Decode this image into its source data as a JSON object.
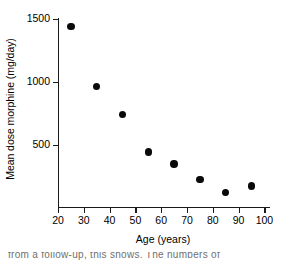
{
  "chart_data": {
    "type": "scatter",
    "title": "",
    "xlabel": "Age (years)",
    "ylabel": "Mean dose morphine (mg/day)",
    "x": [
      25,
      35,
      45,
      55,
      65,
      75,
      85,
      95
    ],
    "values": [
      1440,
      970,
      745,
      450,
      355,
      230,
      130,
      180
    ],
    "series": [
      {
        "name": "Mean dose morphine",
        "points": [
          {
            "x": 25,
            "y": 1440
          },
          {
            "x": 35,
            "y": 970
          },
          {
            "x": 45,
            "y": 745
          },
          {
            "x": 55,
            "y": 450
          },
          {
            "x": 65,
            "y": 355
          },
          {
            "x": 75,
            "y": 230
          },
          {
            "x": 85,
            "y": 130
          },
          {
            "x": 95,
            "y": 180
          }
        ],
        "marker": "filled-circle",
        "color": "#0a0a0a"
      }
    ],
    "xlim": [
      20,
      102
    ],
    "ylim": [
      0,
      1560
    ],
    "xticks": [
      20,
      30,
      40,
      50,
      60,
      70,
      80,
      90,
      100
    ],
    "xtick_labels": [
      "20",
      "30",
      "40",
      "50",
      "60",
      "70",
      "80",
      "90",
      "100"
    ],
    "yticks": [
      500,
      1000,
      1500
    ],
    "ytick_labels": [
      "500",
      "1000",
      "1500"
    ],
    "grid": false,
    "legend": null,
    "axis_color": "#1a1a1a",
    "background": "#ffffff"
  },
  "caption": {
    "fragment": "from a follow-up, this shows. The numbers of"
  }
}
